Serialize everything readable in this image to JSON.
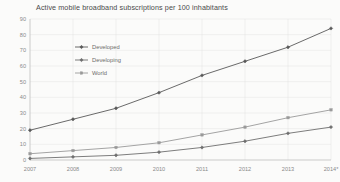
{
  "chart_data": {
    "type": "line",
    "title": "Active mobile broadband subscriptions per 100 inhabitants",
    "xlabel": "",
    "ylabel": "",
    "categories": [
      "2007",
      "2008",
      "2009",
      "2010",
      "2011",
      "2012",
      "2013",
      "2014*"
    ],
    "x_tick_labels": [
      "2007",
      "2008",
      "2009",
      "2010",
      "2011",
      "2012",
      "2013",
      "2014*"
    ],
    "y_tick_labels": [
      "0",
      "10",
      "20",
      "30",
      "40",
      "50",
      "60",
      "70",
      "80",
      "90"
    ],
    "y_ticks": [
      0,
      10,
      20,
      30,
      40,
      50,
      60,
      70,
      80,
      90
    ],
    "ylim": [
      0,
      90
    ],
    "grid": true,
    "legend_position": "upper-left-inside",
    "series": [
      {
        "name": "Developed",
        "color": "#595959",
        "marker": "diamond",
        "values": [
          19,
          26,
          33,
          43,
          54,
          63,
          72,
          84
        ]
      },
      {
        "name": "Developing",
        "color": "#6e6e6e",
        "marker": "diamond",
        "values": [
          1,
          2,
          3,
          5,
          8,
          12,
          17,
          21
        ]
      },
      {
        "name": "World",
        "color": "#9a9a9a",
        "marker": "square",
        "values": [
          4,
          6,
          8,
          11,
          16,
          21,
          27,
          32
        ]
      }
    ]
  },
  "footnote": ""
}
